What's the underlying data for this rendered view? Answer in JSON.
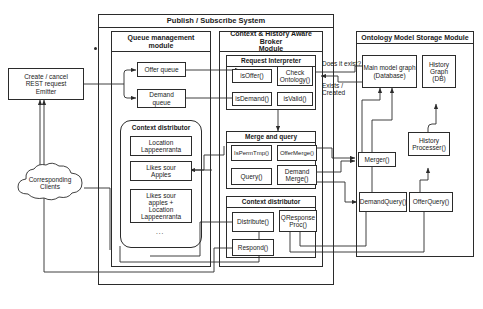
{
  "diagram": {
    "title": "Publish / Subscribe System",
    "external": {
      "emitter": "Create / cancel\nREST request\nEmitter",
      "clients": "Corresponding\nClients"
    },
    "queue_module": {
      "title": "Queue management\nmodule",
      "offer_queue": "Offer queue",
      "demand_queue": "Demand\nqueue",
      "context_distributor": {
        "title": "Context distributor",
        "items": [
          "Location\nLappeenranta",
          "Likes sour\nApples",
          "Likes sour\napples +\nLocation\nLappeenranta"
        ],
        "ellipsis": "..."
      }
    },
    "broker_module": {
      "title": "Context & History Aware Broker\nModule",
      "request_interpreter": {
        "title": "Request Interpreter",
        "items": [
          "isOffer()",
          "Check\nOntology()",
          "isDemand()",
          "isValid()"
        ]
      },
      "merge_and_query": {
        "title": "Merge and query",
        "items": [
          "IsPermTmp()",
          "OfferMerge()",
          "Query()",
          "Demand\nMerge()"
        ]
      },
      "context_distributor": {
        "title": "Context distributor",
        "items": [
          "Distribute()",
          "QResponse\nProc()",
          "Respond()"
        ]
      }
    },
    "ontology_module": {
      "title": "Ontology Model Storage Module",
      "main_model_graph": "Main model graph\n(Database)",
      "history_graph": "History\nGraph\n(DB)",
      "merger": "Merger()",
      "history_processer": "History\nProcesser()",
      "demand_query": "DemandQuery()",
      "offer_query": "OfferQuery()"
    },
    "edge_labels": {
      "does_it_exist": "Does it exist?",
      "exists_created": "Exists /\nCreated"
    }
  }
}
